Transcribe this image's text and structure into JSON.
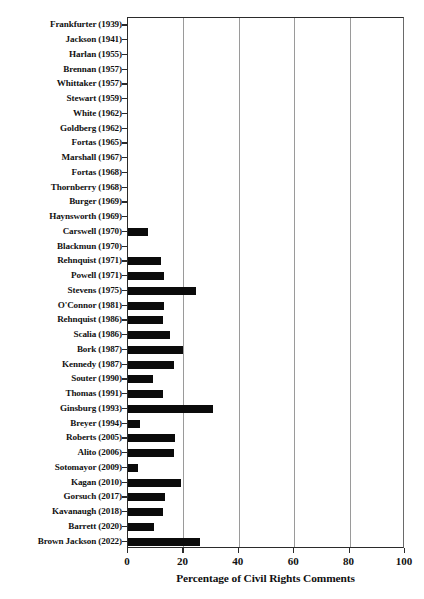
{
  "chart_data": {
    "type": "bar",
    "orientation": "horizontal",
    "title": "",
    "xlabel": "Percentage of Civil Rights Comments",
    "ylabel": "",
    "xlim": [
      0,
      100
    ],
    "xticks": [
      0,
      20,
      40,
      60,
      80,
      100
    ],
    "xtick_labels": [
      "0",
      "20",
      "40",
      "60",
      "80",
      "100"
    ],
    "grid": "vertical gridlines at 20, 40, 60, 80",
    "legend": "none",
    "bar_color": "#0b0b0b",
    "categories": [
      "Frankfurter (1939)",
      "Jackson (1941)",
      "Harlan (1955)",
      "Brennan (1957)",
      "Whittaker (1957)",
      "Stewart (1959)",
      "White (1962)",
      "Goldberg (1962)",
      "Fortas (1965)",
      "Marshall (1967)",
      "Fortas (1968)",
      "Thornberry (1968)",
      "Burger (1969)",
      "Haynsworth (1969)",
      "Carswell (1970)",
      "Blackmun (1970)",
      "Rehnquist (1971)",
      "Powell (1971)",
      "Stevens (1975)",
      "O'Connor (1981)",
      "Rehnquist (1986)",
      "Scalia (1986)",
      "Bork (1987)",
      "Kennedy (1987)",
      "Souter (1990)",
      "Thomas (1991)",
      "Ginsburg (1993)",
      "Breyer (1994)",
      "Roberts (2005)",
      "Alito (2006)",
      "Sotomayor (2009)",
      "Kagan (2010)",
      "Gorsuch (2017)",
      "Kavanaugh (2018)",
      "Barrett (2020)",
      "Brown Jackson (2022)"
    ],
    "values": [
      0,
      0,
      0,
      0,
      0,
      0,
      0,
      0,
      0,
      0,
      0,
      0,
      0,
      0,
      7.2,
      0,
      12.0,
      13.0,
      24.5,
      13.0,
      12.5,
      15.0,
      20.0,
      16.5,
      9.0,
      12.5,
      30.7,
      4.5,
      17.0,
      16.5,
      3.5,
      19.0,
      13.5,
      12.5,
      9.5,
      26.0
    ]
  }
}
